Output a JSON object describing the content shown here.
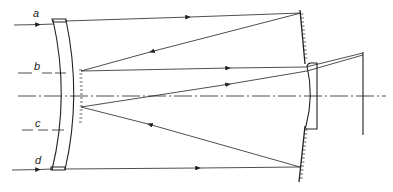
{
  "diagram": {
    "type": "optical ray diagram (catadioptric mirror system)",
    "ray_labels": [
      "a",
      "b",
      "c",
      "d"
    ],
    "elements": {
      "corrector_meniscus": "front meniscus lens with mirrored rear surface (left)",
      "primary_mirror": "concave mirror (right, hatched)",
      "secondary_lens": "small lens near axis (right)",
      "focal_plane": "vertical line at image plane",
      "optical_axis": "dash-dot horizontal axis"
    },
    "colors": {
      "line": "#222222",
      "background": "#ffffff"
    }
  }
}
